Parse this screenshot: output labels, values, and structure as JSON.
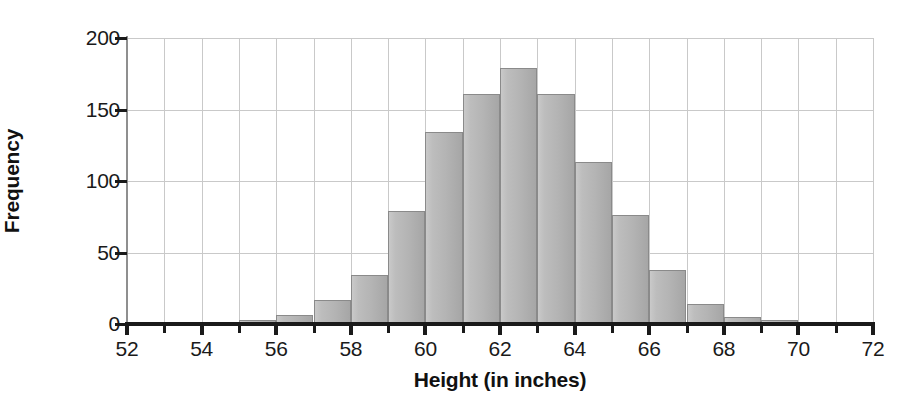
{
  "chart_data": {
    "type": "bar",
    "title": "",
    "xlabel": "Height (in inches)",
    "ylabel": "Frequency",
    "xlim": [
      52,
      72
    ],
    "ylim": [
      0,
      200
    ],
    "grid": true,
    "legend": null,
    "bin_width": 1,
    "x_ticks": [
      52,
      53,
      54,
      55,
      56,
      57,
      58,
      59,
      60,
      61,
      62,
      63,
      64,
      65,
      66,
      67,
      68,
      69,
      70,
      71,
      72
    ],
    "x_tick_labels": [
      "52",
      "",
      "54",
      "",
      "56",
      "",
      "58",
      "",
      "60",
      "",
      "62",
      "",
      "64",
      "",
      "66",
      "",
      "68",
      "",
      "70",
      "",
      "72"
    ],
    "y_ticks": [
      0,
      50,
      100,
      150,
      200
    ],
    "y_tick_labels": [
      "0",
      "50",
      "100",
      "150",
      "200"
    ],
    "bin_edges": [
      52,
      53,
      54,
      55,
      56,
      57,
      58,
      59,
      60,
      61,
      62,
      63,
      64,
      65,
      66,
      67,
      68,
      69,
      70,
      71,
      72
    ],
    "categories": [
      "52-53",
      "53-54",
      "54-55",
      "55-56",
      "56-57",
      "57-58",
      "58-59",
      "59-60",
      "60-61",
      "61-62",
      "62-63",
      "63-64",
      "64-65",
      "65-66",
      "66-67",
      "67-68",
      "68-69",
      "69-70",
      "70-71",
      "71-72"
    ],
    "values": [
      0,
      0,
      0,
      3,
      6,
      17,
      34,
      79,
      134,
      161,
      179,
      161,
      113,
      76,
      38,
      14,
      5,
      3,
      1,
      0
    ],
    "bar_color": "#b8b8b8",
    "bar_edge_color": "#8a8a8a",
    "grid_color": "#c9c9c9",
    "axis_color": "#1a1a1a"
  }
}
